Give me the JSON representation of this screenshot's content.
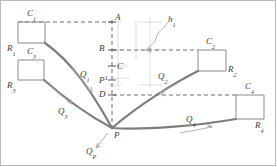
{
  "figure": {
    "type": "hydraulic-network-schematic",
    "colors": {
      "pipe": "#7d7d7d",
      "dashed": "#5a5a5a",
      "reservoir_outline": "#8a8a8a",
      "grid": "#c8c8c8",
      "arrow": "#a8a8a8",
      "text": "#3a3a3a",
      "frame": "#b9b9b9",
      "background": "#ffffff"
    }
  },
  "reservoirs": [
    {
      "id": "r1",
      "tank_label": "R",
      "tank_sub": "1",
      "level_label": "C",
      "level_sub": "1"
    },
    {
      "id": "r3",
      "tank_label": "R",
      "tank_sub": "3",
      "level_label": "C",
      "level_sub": "3"
    },
    {
      "id": "r2",
      "tank_label": "R",
      "tank_sub": "2",
      "level_label": "C",
      "level_sub": "2"
    },
    {
      "id": "r4",
      "tank_label": "R",
      "tank_sub": "4",
      "level_label": "C",
      "level_sub": "4"
    }
  ],
  "flows": [
    {
      "id": "q1",
      "label": "Q",
      "sub": "1"
    },
    {
      "id": "q2",
      "label": "Q",
      "sub": "2"
    },
    {
      "id": "q3",
      "label": "Q",
      "sub": "3"
    },
    {
      "id": "q4",
      "label": "Q",
      "sub": "4"
    },
    {
      "id": "qp",
      "label": "Q",
      "sub": "P"
    }
  ],
  "datum_points": [
    {
      "id": "a",
      "label": "A"
    },
    {
      "id": "b",
      "label": "B"
    },
    {
      "id": "c",
      "label": "C"
    },
    {
      "id": "pprime",
      "label": "P",
      "prime": "1"
    },
    {
      "id": "d",
      "label": "D"
    },
    {
      "id": "p",
      "label": "P"
    }
  ],
  "dimensions": [
    {
      "id": "h1",
      "label": "h",
      "sub": "1"
    }
  ]
}
